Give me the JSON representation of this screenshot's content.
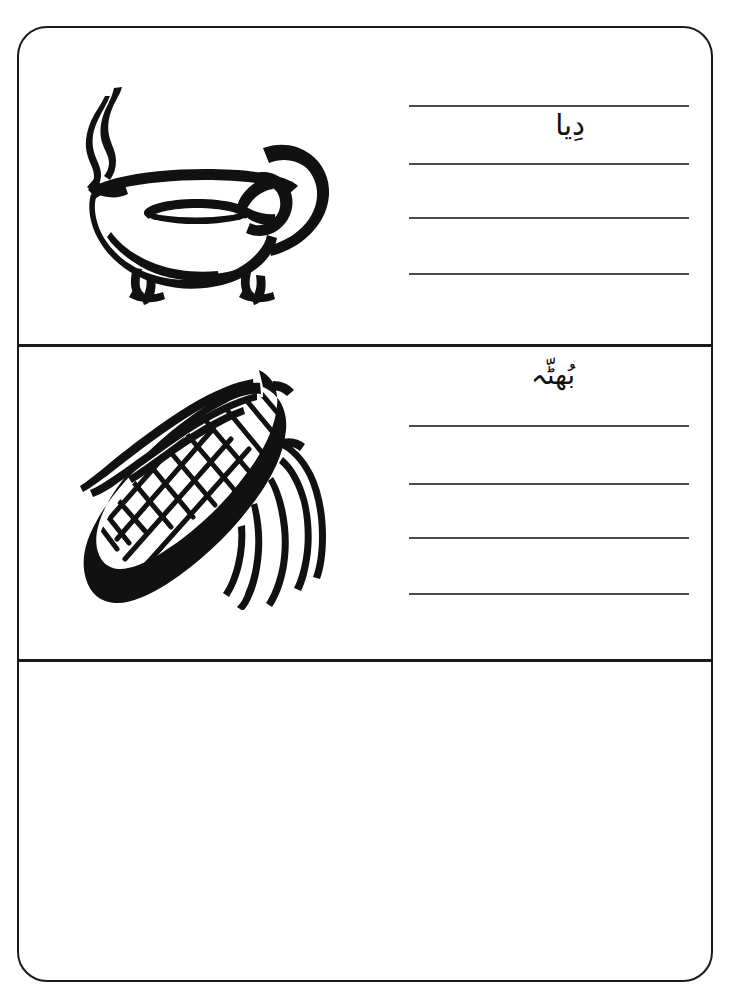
{
  "worksheet": {
    "title": "Urdu vocabulary tracing worksheet",
    "frame": {
      "border_color": "#1a1a1a",
      "background_color": "#ffffff",
      "corner_radius": "30px"
    },
    "rule_line_color": "#4d4d4d",
    "ink_color": "#111111"
  },
  "panels": [
    {
      "id": "panel-1",
      "illustration": {
        "icon_name": "oil-lamp-illustration",
        "description": "Traditional clay oil lamp (diya) with lit flame, oval oil opening, curved handle and two small feet"
      },
      "word": "دِیا",
      "transliteration": "diya",
      "lines": [
        "",
        "",
        "",
        ""
      ],
      "line_count": 4
    },
    {
      "id": "panel-2",
      "illustration": {
        "icon_name": "corn-cob-illustration",
        "description": "Corn cob (bhutta) on the cob with husk leaves, drawn diagonally"
      },
      "word": "بُھٹّہ",
      "transliteration": "bhutta",
      "lines": [
        "",
        "",
        "",
        ""
      ],
      "line_count": 4
    },
    {
      "id": "panel-3",
      "illustration": {
        "icon_name": "blank-illustration-area",
        "description": "Empty panel reserved for the next picture and word"
      },
      "word": "",
      "transliteration": "",
      "lines": [],
      "line_count": 0
    }
  ]
}
